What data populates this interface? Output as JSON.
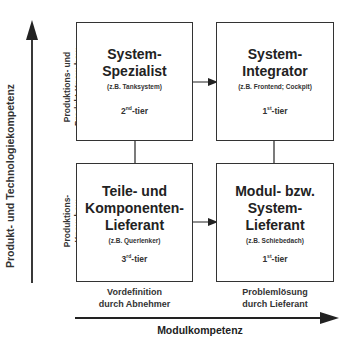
{
  "axes": {
    "y_label": "Produkt- und Technologiekompetenz",
    "x_label": "Modulkompetenz"
  },
  "row_labels": {
    "top": "Produktions- und Produkt-Know-how",
    "top_line1": "Produktions- und",
    "top_line2": "Produkt-Know-how",
    "bottom": "Produktions- Know-how",
    "bottom_line1": "Produktions-",
    "bottom_line2": "Know-how"
  },
  "column_labels": {
    "left_line1": "Vordefinition",
    "left_line2": "durch Abnehmer",
    "right_line1": "Problemlösung",
    "right_line2": "durch Lieferant"
  },
  "boxes": {
    "top_left": {
      "title_line1": "System-",
      "title_line2": "Spezialist",
      "example": "(z.B. Tanksystem)",
      "tier_num": "2",
      "tier_sup": "nd",
      "tier_suffix": "-tier"
    },
    "top_right": {
      "title_line1": "System-",
      "title_line2": "Integrator",
      "example": "(z.B. Frontend; Cockpit)",
      "tier_num": "1",
      "tier_sup": "st",
      "tier_suffix": "-tier"
    },
    "bottom_left": {
      "title_line1": "Teile- und",
      "title_line2": "Komponenten-",
      "title_line3": "Lieferant",
      "example": "(z.B. Querlenker)",
      "tier_num": "3",
      "tier_sup": "rd",
      "tier_suffix": "-tier"
    },
    "bottom_right": {
      "title_line1": "Modul- bzw.",
      "title_line2": "System-",
      "title_line3": "Lieferant",
      "example": "(z.B. Schiebedach)",
      "tier_num": "1",
      "tier_sup": "st",
      "tier_suffix": "-tier"
    }
  },
  "colors": {
    "line": "#222222",
    "text": "#222222",
    "background": "#ffffff"
  }
}
